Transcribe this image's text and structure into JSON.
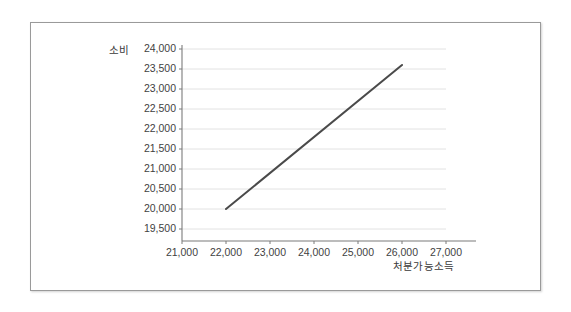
{
  "chart_data": {
    "type": "line",
    "title": "",
    "xlabel": "처분가능소득",
    "ylabel": "소비",
    "xlim": [
      21000,
      27000
    ],
    "ylim": [
      19500,
      24000
    ],
    "xticks": [
      "21,000",
      "22,000",
      "23,000",
      "24,000",
      "25,000",
      "26,000",
      "27,000"
    ],
    "xtick_values": [
      21000,
      22000,
      23000,
      24000,
      25000,
      26000,
      27000
    ],
    "yticks": [
      "19,500",
      "20,000",
      "20,500",
      "21,000",
      "21,500",
      "22,000",
      "22,500",
      "23,000",
      "23,500",
      "24,000"
    ],
    "ytick_values": [
      19500,
      20000,
      20500,
      21000,
      21500,
      22000,
      22500,
      23000,
      23500,
      24000
    ],
    "grid": true,
    "grid_axis": "y",
    "legend": false,
    "series": [
      {
        "name": "소비함수",
        "color": "#4a4a4a",
        "linewidth": 2,
        "x": [
          22000,
          26000
        ],
        "values": [
          20000,
          23600
        ]
      }
    ]
  },
  "colors": {
    "frame_border": "#9a9a9a",
    "axis_line": "#7b7b7b",
    "gridline": "#e2e2e2",
    "line": "#4a4a4a",
    "text": "#3f3f3f",
    "background": "#ffffff"
  }
}
